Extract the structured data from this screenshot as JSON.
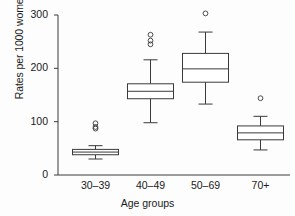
{
  "chart_data": {
    "type": "box",
    "title": "",
    "xlabel": "Age groups",
    "ylabel": "Rates per 1000 women",
    "categories": [
      "30–39",
      "40–49",
      "50–69",
      "70+"
    ],
    "ylim": [
      0,
      300
    ],
    "yticks": [
      0,
      100,
      200,
      300
    ],
    "ytick_labels": [
      "0",
      "100",
      "200",
      "300"
    ],
    "grid": false,
    "legend": "none",
    "boxes": [
      {
        "category": "30–39",
        "whisker_low": 30,
        "q1": 38,
        "median": 43,
        "q3": 48,
        "whisker_high": 55,
        "outliers": [
          87,
          90,
          97
        ]
      },
      {
        "category": "40–49",
        "whisker_low": 98,
        "q1": 143,
        "median": 157,
        "q3": 171,
        "whisker_high": 216,
        "outliers": [
          245,
          252,
          263
        ]
      },
      {
        "category": "50–69",
        "whisker_low": 133,
        "q1": 174,
        "median": 199,
        "q3": 228,
        "whisker_high": 268,
        "outliers": [
          303
        ]
      },
      {
        "category": "70+",
        "whisker_low": 47,
        "q1": 66,
        "median": 79,
        "q3": 92,
        "whisker_high": 110,
        "outliers": [
          144
        ]
      }
    ],
    "colors": {
      "line": "#3a3a3a",
      "box_fill": "#ffffff",
      "background": "#fdfdfd",
      "text": "#1a1a1a"
    }
  }
}
